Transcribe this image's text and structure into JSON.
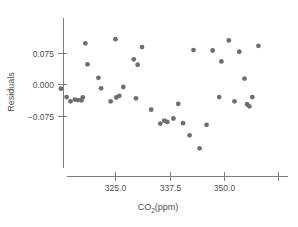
{
  "chart_data": {
    "type": "scatter",
    "title": "",
    "xlabel": "CO2(ppm)",
    "xlabel_base": "CO",
    "xlabel_sub": "2",
    "xlabel_tail": "(ppm)",
    "ylabel": "Residuals",
    "xlim": [
      311.0,
      361.5
    ],
    "ylim": [
      -0.125,
      0.112
    ],
    "grid": false,
    "legend": null,
    "xticks": [
      325.0,
      337.5,
      350.0,
      362.5
    ],
    "xtick_labels": [
      "325.0",
      "337.5",
      "350.0",
      ""
    ],
    "yticks": [
      0.075,
      0.0,
      -0.075
    ],
    "ytick_labels": [
      "0.075",
      "0.000",
      "−0.075"
    ],
    "marker": {
      "shape": "circle",
      "color": "#6e6e6e",
      "radius_px": 2.4
    },
    "points": [
      {
        "x": 312.6,
        "y": -0.01
      },
      {
        "x": 313.9,
        "y": -0.03
      },
      {
        "x": 314.8,
        "y": -0.04
      },
      {
        "x": 315.8,
        "y": -0.036
      },
      {
        "x": 316.5,
        "y": -0.037
      },
      {
        "x": 317.3,
        "y": -0.038
      },
      {
        "x": 317.6,
        "y": -0.031
      },
      {
        "x": 318.2,
        "y": 0.098
      },
      {
        "x": 318.7,
        "y": 0.048
      },
      {
        "x": 321.2,
        "y": 0.016
      },
      {
        "x": 321.8,
        "y": -0.009
      },
      {
        "x": 324.0,
        "y": -0.04
      },
      {
        "x": 325.1,
        "y": 0.108
      },
      {
        "x": 325.3,
        "y": -0.031
      },
      {
        "x": 326.0,
        "y": -0.027
      },
      {
        "x": 326.9,
        "y": -0.006
      },
      {
        "x": 329.3,
        "y": 0.06
      },
      {
        "x": 329.8,
        "y": -0.033
      },
      {
        "x": 330.2,
        "y": 0.047
      },
      {
        "x": 331.2,
        "y": 0.089
      },
      {
        "x": 333.3,
        "y": -0.06
      },
      {
        "x": 335.4,
        "y": -0.093
      },
      {
        "x": 336.3,
        "y": -0.086
      },
      {
        "x": 337.0,
        "y": -0.089
      },
      {
        "x": 338.4,
        "y": -0.081
      },
      {
        "x": 339.5,
        "y": -0.046
      },
      {
        "x": 340.6,
        "y": -0.092
      },
      {
        "x": 342.1,
        "y": -0.121
      },
      {
        "x": 343.0,
        "y": 0.082
      },
      {
        "x": 344.4,
        "y": -0.152
      },
      {
        "x": 346.0,
        "y": -0.096
      },
      {
        "x": 347.4,
        "y": 0.081
      },
      {
        "x": 348.9,
        "y": -0.03
      },
      {
        "x": 349.4,
        "y": 0.055
      },
      {
        "x": 351.1,
        "y": 0.105
      },
      {
        "x": 352.4,
        "y": -0.04
      },
      {
        "x": 353.5,
        "y": 0.078
      },
      {
        "x": 354.7,
        "y": 0.014
      },
      {
        "x": 355.3,
        "y": -0.047
      },
      {
        "x": 355.8,
        "y": -0.052
      },
      {
        "x": 356.5,
        "y": -0.03
      },
      {
        "x": 357.9,
        "y": 0.092
      }
    ]
  },
  "axis": {
    "x_tick_pixels": [
      115,
      170,
      224,
      278
    ],
    "y_tick_pixels": [
      53,
      84,
      116
    ],
    "x_axis_y_px": 176,
    "y_axis_x_px": 63,
    "y_axis_top_px": 18,
    "y_axis_bottom_px": 168,
    "x_axis_left_px": 67,
    "x_axis_right_px": 288
  }
}
